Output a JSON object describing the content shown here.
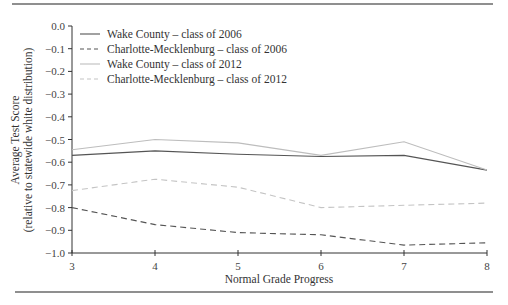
{
  "chart_data": {
    "type": "line",
    "title": "",
    "xlabel": "Normal Grade Progress",
    "ylabel": "Average Test Score",
    "ylabel_sub": "(relative to statewide white distribution)",
    "x": [
      3,
      4,
      5,
      6,
      7,
      8
    ],
    "x_tick_labels": [
      "3",
      "4",
      "5",
      "6",
      "7",
      "8"
    ],
    "y_tick_values": [
      0.0,
      -0.1,
      -0.2,
      -0.3,
      -0.4,
      -0.5,
      -0.6,
      -0.7,
      -0.8,
      -0.9,
      -1.0
    ],
    "y_tick_labels": [
      "0.0",
      "−0.1",
      "−0.2",
      "−0.3",
      "−0.4",
      "−0.5",
      "−0.6",
      "−0.7",
      "−0.8",
      "−0.9",
      "−1.0"
    ],
    "xlim": [
      3,
      8
    ],
    "ylim": [
      -1.0,
      0.0
    ],
    "grid": false,
    "legend_position": "upper left",
    "series": [
      {
        "name": "Wake County – class of 2006",
        "values": [
          -0.57,
          -0.55,
          -0.565,
          -0.575,
          -0.57,
          -0.635
        ],
        "color": "#555555",
        "dash": "solid"
      },
      {
        "name": "Charlotte-Mecklenburg – class of 2006",
        "values": [
          -0.8,
          -0.875,
          -0.91,
          -0.92,
          -0.965,
          -0.955
        ],
        "color": "#555555",
        "dash": "dashed"
      },
      {
        "name": "Wake County – class of 2012",
        "values": [
          -0.545,
          -0.5,
          -0.515,
          -0.57,
          -0.51,
          -0.635
        ],
        "color": "#bdbdbd",
        "dash": "solid"
      },
      {
        "name": "Charlotte-Mecklenburg – class of 2012",
        "values": [
          -0.725,
          -0.675,
          -0.71,
          -0.8,
          -0.79,
          -0.78
        ],
        "color": "#c4c4c4",
        "dash": "dashed"
      }
    ]
  }
}
